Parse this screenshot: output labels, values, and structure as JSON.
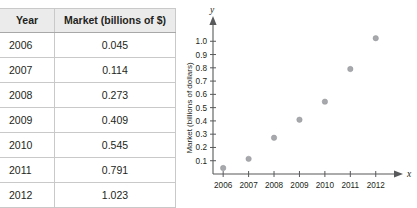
{
  "table": {
    "headers": [
      "Year",
      "Market (billions of $)"
    ],
    "rows": [
      {
        "year": "2006",
        "market": "0.045"
      },
      {
        "year": "2007",
        "market": "0.114"
      },
      {
        "year": "2008",
        "market": "0.273"
      },
      {
        "year": "2009",
        "market": "0.409"
      },
      {
        "year": "2010",
        "market": "0.545"
      },
      {
        "year": "2011",
        "market": "0.791"
      },
      {
        "year": "2012",
        "market": "1.023"
      }
    ]
  },
  "chart_data": {
    "type": "scatter",
    "title": "",
    "xlabel": "x",
    "ylabel": "Market (billions of dollars)",
    "x_axis_name": "x",
    "y_axis_name": "y",
    "categories": [
      "2006",
      "2007",
      "2008",
      "2009",
      "2010",
      "2011",
      "2012"
    ],
    "x": [
      2006,
      2007,
      2008,
      2009,
      2010,
      2011,
      2012
    ],
    "values": [
      0.045,
      0.114,
      0.273,
      0.409,
      0.545,
      0.791,
      1.023
    ],
    "xtick_labels": [
      "2006",
      "2007",
      "2008",
      "2009",
      "2010",
      "2011",
      "2012"
    ],
    "ytick_labels": [
      "0.1",
      "0.2",
      "0.3",
      "0.4",
      "0.5",
      "0.6",
      "0.7",
      "0.8",
      "0.9",
      "1.0"
    ],
    "ytick_values": [
      0.1,
      0.2,
      0.3,
      0.4,
      0.5,
      0.6,
      0.7,
      0.8,
      0.9,
      1.0
    ],
    "xlim": [
      2005.6,
      2012.6
    ],
    "ylim": [
      0,
      1.1
    ],
    "grid": false,
    "legend": null,
    "point_color": "#a6a8ab",
    "axis_color": "#58595b"
  },
  "colors": {
    "header_bg": "#ebebeb",
    "border": "#c9c9c9",
    "text": "#231f20",
    "point": "#a6a8ab",
    "axis": "#58595b"
  }
}
